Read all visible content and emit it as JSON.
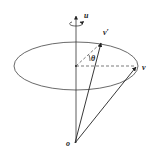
{
  "diagram": {
    "labels": {
      "axis": "u",
      "rotated_vector": "v′",
      "angle": "θ",
      "vector": "v",
      "origin": "o"
    },
    "colors": {
      "stroke": "#333333",
      "background": "#ffffff"
    }
  }
}
